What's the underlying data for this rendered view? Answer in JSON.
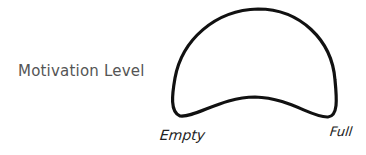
{
  "diagram": {
    "y_axis_label": "Motivation Level",
    "x_axis_labels": {
      "left": "Empty",
      "right": "Full"
    },
    "shape": {
      "description": "hand-drawn mound / dome shape with a shallow upward dip along its base",
      "stroke_color": "#111111",
      "fill_color": "#ffffff"
    }
  }
}
